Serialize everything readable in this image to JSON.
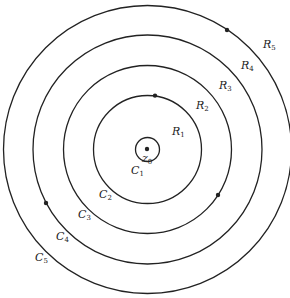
{
  "diagram": {
    "center_label": {
      "base": "z",
      "sub": "0"
    },
    "circles": [
      {
        "name": "C",
        "sub": "1"
      },
      {
        "name": "C",
        "sub": "2"
      },
      {
        "name": "C",
        "sub": "3"
      },
      {
        "name": "C",
        "sub": "4"
      },
      {
        "name": "C",
        "sub": "5"
      }
    ],
    "regions": [
      {
        "name": "R",
        "sub": "1"
      },
      {
        "name": "R",
        "sub": "2"
      },
      {
        "name": "R",
        "sub": "3"
      },
      {
        "name": "R",
        "sub": "4"
      },
      {
        "name": "R",
        "sub": "5"
      }
    ],
    "colors": {
      "stroke": "#222222",
      "background": "#ffffff"
    }
  }
}
